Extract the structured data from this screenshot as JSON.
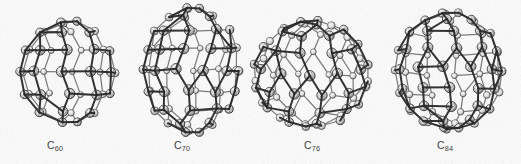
{
  "figure": {
    "background_color": "#fdfdfd",
    "width": 521,
    "height": 164,
    "style": "halftone scanned ball-and-stick molecular models",
    "bond_color": "#1d1d1d",
    "atom_fill_light": "#f2f2f2",
    "atom_fill_shaded": "#8d8d8d",
    "atom_outline_color": "#232323",
    "caption_color": "#35353a"
  },
  "molecules": [
    {
      "id": "c60",
      "label_element": "C",
      "label_subscript": "60",
      "label_full": "C60",
      "atom_count": 60,
      "shape": "sphere",
      "width_ratio": 1.0,
      "height_ratio": 1.0,
      "center_x": 67,
      "center_y": 72,
      "radius_x": 48,
      "radius_y": 51,
      "rings_latitude": 7,
      "atoms_per_ring": 10,
      "tilt_deg": 0,
      "caption_center_x": 55,
      "caption_y": 140
    },
    {
      "id": "c70",
      "label_element": "C",
      "label_subscript": "70",
      "label_full": "C70",
      "atom_count": 70,
      "shape": "prolate-ellipsoid",
      "width_ratio": 0.82,
      "height_ratio": 1.0,
      "center_x": 192,
      "center_y": 70,
      "radius_x": 48,
      "radius_y": 62,
      "rings_latitude": 9,
      "atoms_per_ring": 11,
      "tilt_deg": 0,
      "caption_center_x": 182,
      "caption_y": 140
    },
    {
      "id": "c76",
      "label_element": "C",
      "label_subscript": "76",
      "label_full": "C76",
      "atom_count": 76,
      "shape": "oblate-ellipsoid",
      "width_ratio": 1.12,
      "height_ratio": 1.0,
      "center_x": 311,
      "center_y": 74,
      "radius_x": 58,
      "radius_y": 54,
      "rings_latitude": 8,
      "atoms_per_ring": 12,
      "tilt_deg": -12,
      "caption_center_x": 312,
      "caption_y": 140
    },
    {
      "id": "c84",
      "label_element": "C",
      "label_subscript": "84",
      "label_full": "C84",
      "atom_count": 84,
      "shape": "sphere",
      "width_ratio": 1.0,
      "height_ratio": 1.04,
      "center_x": 449,
      "center_y": 71,
      "radius_x": 54,
      "radius_y": 59,
      "rings_latitude": 9,
      "atoms_per_ring": 12,
      "tilt_deg": 4,
      "caption_center_x": 445,
      "caption_y": 140
    }
  ]
}
